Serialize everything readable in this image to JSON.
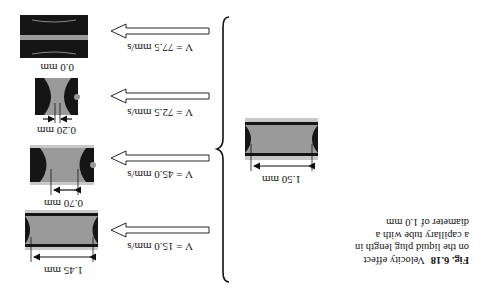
{
  "figure": {
    "label": "Fig. 6.18",
    "caption_lines": [
      "Velocity effect",
      "on the liquid plug length in",
      "a capillary tube with a",
      "diameter of 1.0 mm"
    ]
  },
  "initial_plug": {
    "length_label": "1.50 mm"
  },
  "cases": [
    {
      "velocity_label": "V = 15.0 mm/s",
      "length_label": "1.45 mm"
    },
    {
      "velocity_label": "V = 45.0 mm/s",
      "length_label": "0.70 mm"
    },
    {
      "velocity_label": "V = 72.5 mm/s",
      "length_label": "0.20 mm"
    },
    {
      "velocity_label": "V = 77.5 mm/s",
      "length_label": "0.0 mm"
    }
  ],
  "colors": {
    "liquid": "#9a9a9a",
    "gas": "#151515",
    "wall": "#c8c8c8",
    "background": "#ffffff"
  },
  "orientation": "rotated 180 degrees"
}
